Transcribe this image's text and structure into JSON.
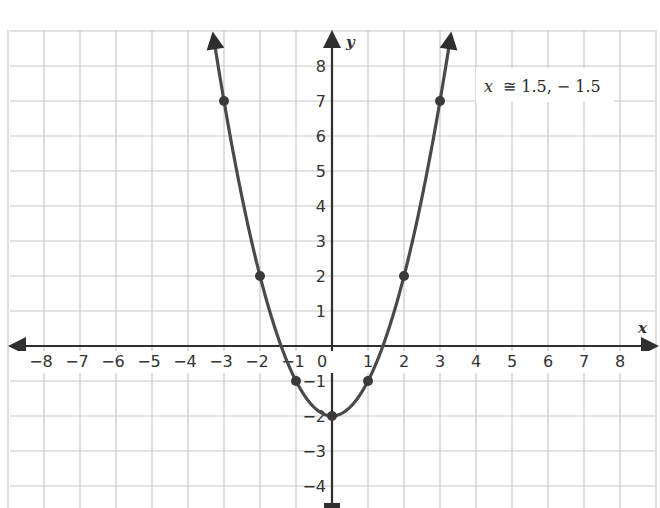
{
  "chart_data": {
    "type": "line",
    "title": "",
    "function": "y = x^2 - 2",
    "xlabel": "x",
    "ylabel": "y",
    "xlim": [
      -9,
      9
    ],
    "ylim": [
      -4.6,
      9
    ],
    "grid": true,
    "x_ticks": [
      "-8",
      "-7",
      "-6",
      "-5",
      "-4",
      "-3",
      "-2",
      "-1",
      "0",
      "1",
      "2",
      "3",
      "4",
      "5",
      "6",
      "7",
      "8"
    ],
    "y_ticks": [
      "8",
      "7",
      "6",
      "5",
      "4",
      "3",
      "2",
      "1",
      "-1",
      "-2",
      "-3",
      "-4"
    ],
    "origin_label": "0",
    "points": [
      {
        "x": -3,
        "y": 7
      },
      {
        "x": -2,
        "y": 2
      },
      {
        "x": -1,
        "y": -1
      },
      {
        "x": 0,
        "y": -2
      },
      {
        "x": 1,
        "y": -1
      },
      {
        "x": 2,
        "y": 2
      },
      {
        "x": 3,
        "y": 7
      }
    ],
    "series": [
      {
        "name": "y = x^2 - 2",
        "x": [
          -3,
          -2,
          -1,
          0,
          1,
          2,
          3
        ],
        "values": [
          7,
          2,
          -1,
          -2,
          -1,
          2,
          7
        ]
      }
    ],
    "annotation": {
      "variable": "x",
      "symbol": "≅",
      "text": "1.5, − 1.5"
    },
    "colors": {
      "curve": "#4a4a4a",
      "axes": "#2f2f2f",
      "grid": "#c8c8c8",
      "text": "#333333"
    }
  }
}
